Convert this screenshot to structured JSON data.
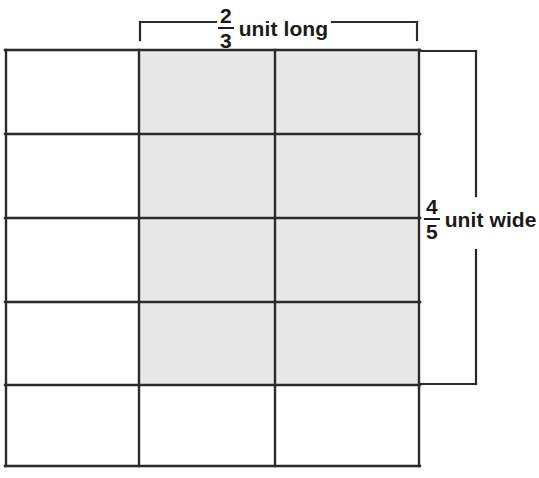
{
  "figure": {
    "type": "area-model-fraction-grid",
    "background_color": "#ffffff",
    "line_color": "#2b2b2b",
    "shade_color": "#e8e8e8",
    "grid": {
      "columns": 3,
      "rows": 5,
      "x_edges": [
        5,
        139,
        275,
        420
      ],
      "y_edges": [
        50,
        134,
        218,
        302,
        385,
        467
      ],
      "shaded_columns": [
        2,
        3
      ],
      "shaded_rows": [
        1,
        2,
        3,
        4
      ],
      "shaded_cell_count": 8,
      "total_cell_count": 15
    },
    "top_bracket": {
      "x_start": 139,
      "x_end": 418,
      "y": 22,
      "tick_height": 18
    },
    "right_bracket": {
      "x": 477,
      "y_start": 50,
      "y_end": 385,
      "tick_length": 57
    }
  },
  "labels": {
    "long": {
      "numerator": "2",
      "denominator": "3",
      "unit_text": "unit long"
    },
    "wide": {
      "numerator": "4",
      "denominator": "5",
      "unit_text": "unit wide"
    }
  }
}
